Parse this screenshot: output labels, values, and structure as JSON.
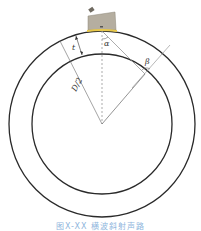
{
  "figure": {
    "labels": {
      "thickness": "t",
      "radius": "D/2",
      "alpha": "α",
      "beta": "β"
    },
    "caption": "图X-XX  横波斜射声路",
    "colors": {
      "circle_stroke": "#2a2a2a",
      "line_stroke": "#888888",
      "probe_body": "#b5aea0",
      "couplant": "#e8c84a",
      "caption": "#8fb6dd"
    }
  }
}
